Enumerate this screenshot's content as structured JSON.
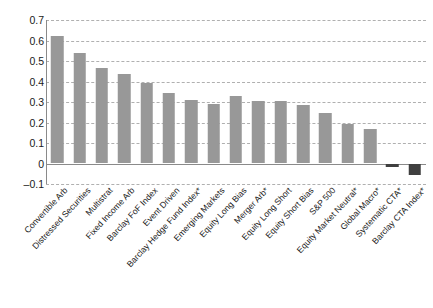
{
  "chart_data": {
    "type": "bar",
    "title": "",
    "subtitle": "",
    "xlabel": "",
    "ylabel": "",
    "ylim": [
      -0.1,
      0.7
    ],
    "grid": true,
    "legend": null,
    "orientation": "vertical",
    "y_ticks": [
      "0.7",
      "0.6",
      "0.5",
      "0.4",
      "0.3",
      "0.2",
      "0.1",
      "0",
      "–0.1"
    ],
    "y_tick_values": [
      0.7,
      0.6,
      0.5,
      0.4,
      0.3,
      0.2,
      0.1,
      0,
      -0.1
    ],
    "categories": [
      "Convertible Arb",
      "Distressed Securities",
      "Multistrat",
      "Fixed Income Arb",
      "Barclay FoF Index",
      "Event Driven",
      "Barclay Hedge Fund Index*",
      "Emerging Markets",
      "Equity Long Bias",
      "Merger Arb*",
      "Equity Long Short",
      "Equity Short Bias",
      "S&P 500",
      "Equity Market Neutral*",
      "Global Macro*",
      "Systematic CTA*",
      "Barclay CTA Index*"
    ],
    "values": [
      0.62,
      0.54,
      0.465,
      0.435,
      0.395,
      0.345,
      0.31,
      0.29,
      0.33,
      0.305,
      0.305,
      0.285,
      0.245,
      0.195,
      0.17,
      -0.015,
      -0.055
    ],
    "colors": {
      "positive_bar": "#989898",
      "negative_bar": "#3f3f3f",
      "gridline": "#b0b0b0",
      "axis": "#8a8a8a",
      "text": "#1a1a1a",
      "background": "#ffffff"
    }
  }
}
